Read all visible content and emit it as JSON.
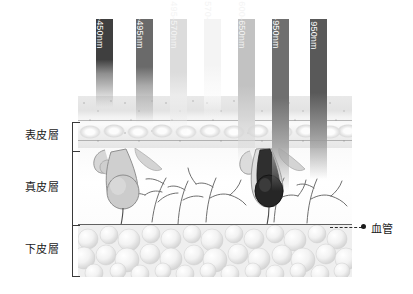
{
  "figure": {
    "layers": [
      {
        "id": "epidermis",
        "label": "表皮層"
      },
      {
        "id": "dermis",
        "label": "真皮層"
      },
      {
        "id": "hypodermis",
        "label": "下皮層"
      }
    ],
    "callout": {
      "label": "血管",
      "marker": "dot-marker",
      "leader": "dashed-leader-line"
    },
    "bracket": {
      "name": "layer-depth-bracket",
      "ticks": 4
    }
  },
  "chart_data": {
    "type": "bar",
    "xlabel": "Wavelength band",
    "ylabel": "Penetration depth into skin",
    "orientation": "vertical-downward",
    "grid": false,
    "legend": "none",
    "categories": [
      "380-450nm",
      "450-495nm",
      "495-570nm",
      "570-600nm",
      "600-650nm",
      "650-950nm",
      "over 950nm"
    ],
    "series": [
      {
        "name": "Penetration depth",
        "units": "relative depth (0 = surface, 1 = hypodermis base)",
        "values": [
          0.44,
          0.52,
          0.58,
          0.5,
          0.72,
          0.86,
          0.8
        ]
      }
    ],
    "annotations": [
      {
        "text": "表皮層",
        "meaning": "epidermis",
        "depth_band": [
          0.0,
          0.29
        ]
      },
      {
        "text": "真皮層",
        "meaning": "dermis",
        "depth_band": [
          0.29,
          0.71
        ]
      },
      {
        "text": "下皮層",
        "meaning": "hypodermis",
        "depth_band": [
          0.71,
          1.0
        ]
      },
      {
        "text": "血管",
        "meaning": "blood vessel",
        "depth": 0.72
      }
    ]
  },
  "columns": [
    {
      "label": "380-450nm",
      "name": "band-380-450",
      "x": 96,
      "width": 17,
      "height": 88,
      "top_color": "#3f3f3f",
      "mid_color": "#8f8f8f",
      "fade_stop": 62,
      "text_dim": false
    },
    {
      "label": "450-495nm",
      "name": "band-450-495",
      "x": 136,
      "width": 17,
      "height": 104,
      "top_color": "#6a6a6a",
      "mid_color": "#aaaaaa",
      "fade_stop": 64,
      "text_dim": false
    },
    {
      "label": "495-570nm",
      "name": "band-495-570",
      "x": 170,
      "width": 17,
      "height": 116,
      "top_color": "#dcdcdc",
      "mid_color": "#ececec",
      "fade_stop": 66,
      "text_dim": true
    },
    {
      "label": "570-600nm",
      "name": "band-570-600",
      "x": 204,
      "width": 17,
      "height": 100,
      "top_color": "#f4f4f4",
      "mid_color": "#fafafa",
      "fade_stop": 66,
      "text_dim": true
    },
    {
      "label": "600-650nm",
      "name": "band-600-650",
      "x": 238,
      "width": 17,
      "height": 144,
      "top_color": "#c2c2c2",
      "mid_color": "#d8d8d8",
      "fade_stop": 70,
      "text_dim": true
    },
    {
      "label": "650-950nm",
      "name": "band-650-950",
      "x": 272,
      "width": 17,
      "height": 172,
      "top_color": "#6f6f6f",
      "mid_color": "#a6a6a6",
      "fade_stop": 72,
      "text_dim": false
    },
    {
      "label": "over 950nm",
      "name": "band-over-950",
      "x": 310,
      "width": 17,
      "height": 160,
      "top_color": "#595959",
      "mid_color": "#9a9a9a",
      "fade_stop": 72,
      "text_dim": false
    }
  ]
}
